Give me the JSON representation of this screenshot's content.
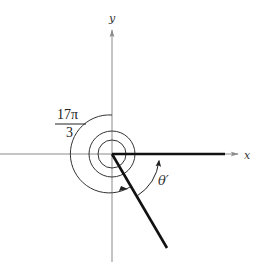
{
  "figure": {
    "type": "reference-angle-diagram",
    "axes": {
      "x_label": "x",
      "y_label": "y"
    },
    "angle_label": {
      "numerator": "17π",
      "denominator": "3"
    },
    "reference_angle_label": "θ′",
    "colors": {
      "axis": "#8a8a8a",
      "ray": "#111111",
      "spiral": "#333333",
      "text": "#222222"
    }
  }
}
